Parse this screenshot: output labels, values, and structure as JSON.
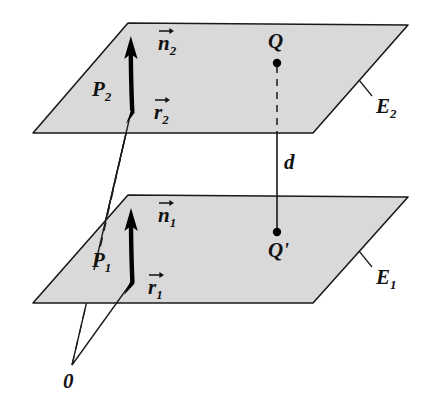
{
  "figure": {
    "colors": {
      "plane_fill": "#d9d9d9",
      "plane_stroke": "#1a1a1a",
      "vector_stroke": "#000000",
      "line_stroke": "#1a1a1a",
      "background": "#ffffff",
      "label_color": "#111111"
    },
    "planes": [
      {
        "id": "upper-plane",
        "label": "E",
        "subscript": "2",
        "label_full": "E₂",
        "points": "128,23 408,25 313,133 33,133"
      },
      {
        "id": "lower-plane",
        "label": "E",
        "subscript": "1",
        "label_full": "E₁",
        "points": "128,195 408,197 313,303 33,303"
      }
    ],
    "labels": {
      "plane_upper": {
        "base": "E",
        "sub": "2"
      },
      "plane_lower": {
        "base": "E",
        "sub": "1"
      },
      "point_p_upper": {
        "base": "P",
        "sub": "2"
      },
      "point_p_lower": {
        "base": "P",
        "sub": "1"
      },
      "normal_upper": {
        "base": "n",
        "sub": "2"
      },
      "normal_lower": {
        "base": "n",
        "sub": "1"
      },
      "radius_upper": {
        "base": "r",
        "sub": "2"
      },
      "radius_lower": {
        "base": "r",
        "sub": "1"
      },
      "point_q": "Q",
      "point_q_prime": "Q'",
      "distance": "d",
      "origin": "0"
    },
    "icons": {
      "normal_vector": "up-arrow-icon",
      "position_vector": "up-arrow-icon",
      "overline_arrow": "vector-overline-arrow-icon",
      "point_marker": "filled-dot-icon"
    },
    "geometry": {
      "origin_point": {
        "x": 72,
        "y": 365
      },
      "p_upper": {
        "x": 129,
        "y": 110
      },
      "p_lower": {
        "x": 129,
        "y": 281
      },
      "q_point": {
        "x": 277,
        "y": 63
      },
      "q_prime_point": {
        "x": 277,
        "y": 232
      },
      "distance_segment": {
        "x": 277,
        "y1": 128,
        "y2": 232
      },
      "dashed_segment": {
        "x": 277,
        "y1": 63,
        "y2": 128
      }
    }
  }
}
